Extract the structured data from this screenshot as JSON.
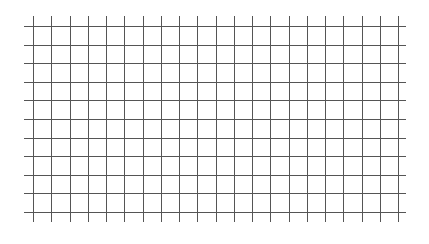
{
  "grid": {
    "line_color": "#555555",
    "background": "#ffffff",
    "vertical": {
      "count": 21,
      "x_start": 33,
      "x_end": 398,
      "y_top": 16,
      "y_bottom": 222
    },
    "horizontal": {
      "count": 11,
      "y_start": 26,
      "y_end": 212,
      "x_left": 24,
      "x_right": 406
    }
  }
}
